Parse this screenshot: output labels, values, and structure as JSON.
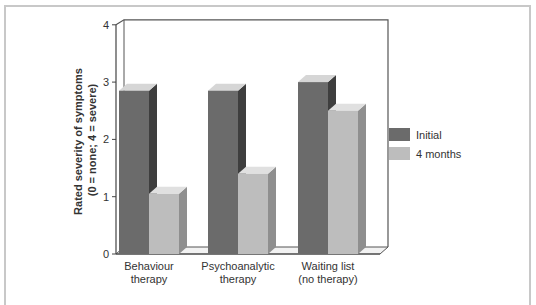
{
  "chart_data": {
    "type": "bar",
    "style": "3d-grouped",
    "title": "",
    "ylabel": "Rated severity of symptoms (0 = none; 4 = severe)",
    "ylabel_lines": [
      "Rated severity of symptoms",
      "(0 = none; 4 = severe)"
    ],
    "xlabel": "",
    "ylim": [
      0,
      4
    ],
    "yticks": [
      "0",
      "1",
      "2",
      "3",
      "4"
    ],
    "grid": false,
    "legend_position": "right",
    "categories": [
      "Behaviour therapy",
      "Psychoanalytic therapy",
      "Waiting list (no therapy)"
    ],
    "category_lines": [
      [
        "Behaviour",
        "therapy"
      ],
      [
        "Psychoanalytic",
        "therapy"
      ],
      [
        "Waiting list",
        "(no therapy)"
      ]
    ],
    "series": [
      {
        "name": "Initial",
        "values": [
          2.85,
          2.85,
          3.0
        ],
        "color": "#6b6b6b"
      },
      {
        "name": "4 months",
        "values": [
          1.05,
          1.4,
          2.5
        ],
        "color": "#bdbdbd"
      }
    ]
  },
  "legend": {
    "items": [
      "Initial",
      "4 months"
    ]
  },
  "colors": {
    "initial_front": "#6b6b6b",
    "initial_side": "#3e3e3e",
    "initial_top": "#d6d6d6",
    "months_front": "#bdbdbd",
    "months_side": "#8f8f8f",
    "months_top": "#e0e0e0",
    "frame": "#c8c8c8"
  }
}
